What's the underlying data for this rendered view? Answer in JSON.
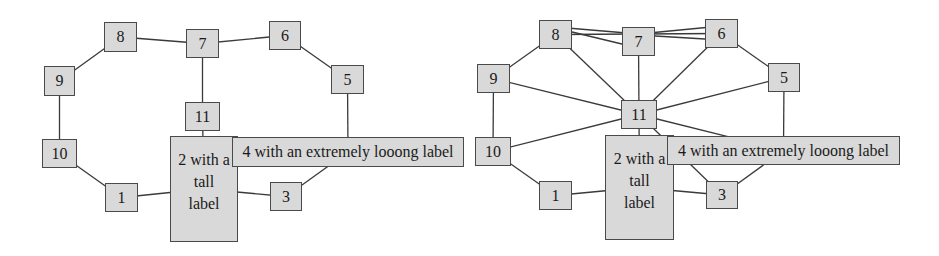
{
  "colors": {
    "node_fill": "#d9d9d9",
    "node_border": "#4a4a4a",
    "edge": "#3a3a3a",
    "background": "#ffffff"
  },
  "graphs": [
    {
      "id": "left",
      "offset_x": 0,
      "nodes": {
        "n1": {
          "label": "1",
          "x": 105,
          "y": 183,
          "w": 33,
          "h": 29
        },
        "n2": {
          "label": "2 with a tall label",
          "lines": [
            "2 with a",
            "tall",
            "label"
          ],
          "x": 170,
          "y": 136,
          "w": 68,
          "h": 106
        },
        "n3": {
          "label": "3",
          "x": 270,
          "y": 182,
          "w": 32,
          "h": 29
        },
        "n4": {
          "label": "4 with an extremely looong label",
          "x": 232,
          "y": 137,
          "w": 232,
          "h": 30
        },
        "n5": {
          "label": "5",
          "x": 331,
          "y": 65,
          "w": 33,
          "h": 29
        },
        "n6": {
          "label": "6",
          "x": 269,
          "y": 21,
          "w": 32,
          "h": 29
        },
        "n7": {
          "label": "7",
          "x": 186,
          "y": 29,
          "w": 33,
          "h": 29
        },
        "n8": {
          "label": "8",
          "x": 104,
          "y": 22,
          "w": 33,
          "h": 30
        },
        "n9": {
          "label": "9",
          "x": 44,
          "y": 66,
          "w": 31,
          "h": 30
        },
        "n10": {
          "label": "10",
          "x": 42,
          "y": 139,
          "w": 35,
          "h": 29
        },
        "n11": {
          "label": "11",
          "x": 185,
          "y": 102,
          "w": 35,
          "h": 29
        }
      },
      "edges": [
        [
          "n8",
          "n7"
        ],
        [
          "n7",
          "n6"
        ],
        [
          "n6",
          "n5"
        ],
        [
          "n8",
          "n9"
        ],
        [
          "n9",
          "n10"
        ],
        [
          "n10",
          "n1"
        ],
        [
          "n1",
          "n2"
        ],
        [
          "n2",
          "n3"
        ],
        [
          "n3",
          "n4"
        ],
        [
          "n5",
          "n4"
        ],
        [
          "n7",
          "n11"
        ],
        [
          "n11",
          "n2"
        ]
      ]
    },
    {
      "id": "right",
      "offset_x": 0,
      "nodes": {
        "n1": {
          "label": "1",
          "x": 539,
          "y": 181,
          "w": 33,
          "h": 29
        },
        "n2": {
          "label": "2 with a tall label",
          "lines": [
            "2 with a",
            "tall",
            "label"
          ],
          "x": 605,
          "y": 135,
          "w": 69,
          "h": 105
        },
        "n3": {
          "label": "3",
          "x": 706,
          "y": 181,
          "w": 32,
          "h": 28
        },
        "n4": {
          "label": "4 with an extremely looong label",
          "x": 667,
          "y": 136,
          "w": 233,
          "h": 29
        },
        "n5": {
          "label": "5",
          "x": 768,
          "y": 63,
          "w": 32,
          "h": 29
        },
        "n6": {
          "label": "6",
          "x": 705,
          "y": 19,
          "w": 33,
          "h": 29
        },
        "n7": {
          "label": "7",
          "x": 622,
          "y": 27,
          "w": 33,
          "h": 29
        },
        "n8": {
          "label": "8",
          "x": 539,
          "y": 20,
          "w": 33,
          "h": 29
        },
        "n9": {
          "label": "9",
          "x": 477,
          "y": 64,
          "w": 33,
          "h": 29
        },
        "n10": {
          "label": "10",
          "x": 475,
          "y": 137,
          "w": 36,
          "h": 29
        },
        "n11": {
          "label": "11",
          "x": 621,
          "y": 100,
          "w": 36,
          "h": 29
        }
      },
      "edges": [
        [
          "n8",
          "n7",
          "top"
        ],
        [
          "n8",
          "n7",
          "bottom"
        ],
        [
          "n7",
          "n6",
          "top"
        ],
        [
          "n7",
          "n6",
          "bottom"
        ],
        [
          "n8",
          "n6"
        ],
        [
          "n6",
          "n5"
        ],
        [
          "n8",
          "n9"
        ],
        [
          "n9",
          "n10"
        ],
        [
          "n10",
          "n1"
        ],
        [
          "n1",
          "n2"
        ],
        [
          "n2",
          "n3"
        ],
        [
          "n3",
          "n4"
        ],
        [
          "n5",
          "n4"
        ],
        [
          "n11",
          "n8"
        ],
        [
          "n11",
          "n7"
        ],
        [
          "n11",
          "n6"
        ],
        [
          "n11",
          "n5"
        ],
        [
          "n11",
          "n9"
        ],
        [
          "n11",
          "n10"
        ],
        [
          "n11",
          "n2"
        ],
        [
          "n11",
          "n4"
        ],
        [
          "n11",
          "n3"
        ]
      ]
    }
  ]
}
